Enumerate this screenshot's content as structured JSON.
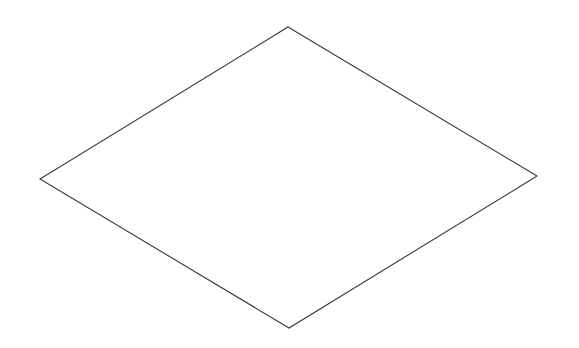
{
  "figure": {
    "shape": "rhombus",
    "stroke_color": "#3a3a3a",
    "fill_color": "none",
    "background_color": "#ffffff"
  }
}
